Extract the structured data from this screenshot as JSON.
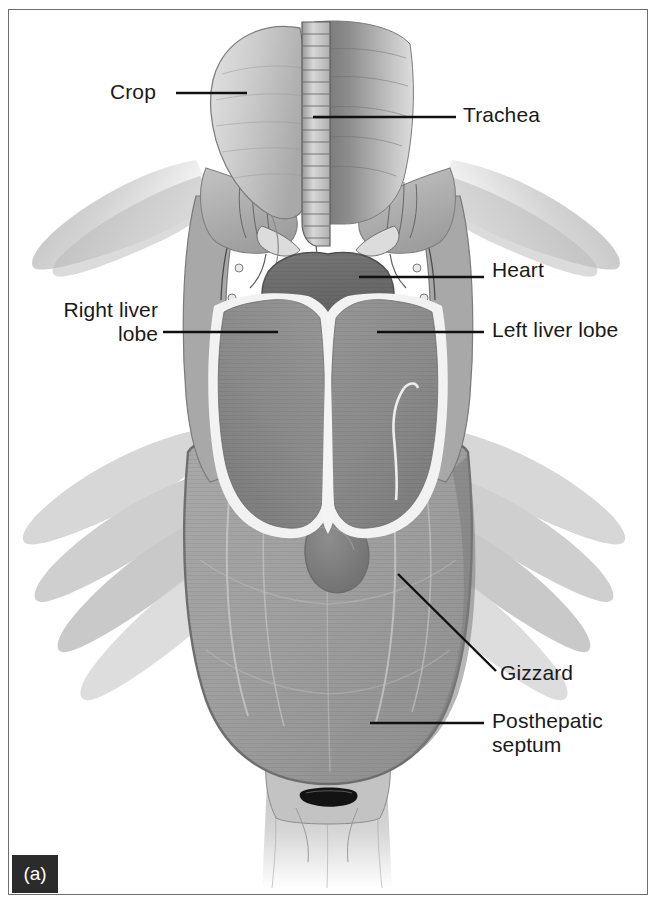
{
  "figure": {
    "panel_tag": "(a)",
    "background_color": "#ffffff",
    "frame_color": "#6d6f71",
    "leader_line_color": "#101010",
    "label_text_color": "#1a1a1a",
    "tag_background_color": "#2b2b2b",
    "tag_text_color": "#ffffff"
  },
  "labels": [
    {
      "id": "crop",
      "text": "Crop",
      "align": "left",
      "x": 110,
      "y": 80,
      "leader": {
        "x1": 176,
        "y1": 93,
        "x2": 247,
        "y2": 93
      }
    },
    {
      "id": "trachea",
      "text": "Trachea",
      "align": "left",
      "x": 463,
      "y": 103,
      "leader": {
        "x1": 313,
        "y1": 117,
        "x2": 456,
        "y2": 117
      }
    },
    {
      "id": "heart",
      "text": "Heart",
      "align": "left",
      "x": 492,
      "y": 258,
      "leader": {
        "x1": 359,
        "y1": 277,
        "x2": 484,
        "y2": 277
      }
    },
    {
      "id": "right-liver-lobe",
      "text": "Right liver\nlobe",
      "align": "right",
      "x": 48,
      "y": 298,
      "leader": {
        "x1": 163,
        "y1": 332,
        "x2": 278,
        "y2": 332
      }
    },
    {
      "id": "left-liver-lobe",
      "text": "Left liver lobe",
      "align": "left",
      "x": 492,
      "y": 318,
      "leader": {
        "x1": 377,
        "y1": 332,
        "x2": 484,
        "y2": 332
      }
    },
    {
      "id": "gizzard",
      "text": "Gizzard",
      "align": "left",
      "x": 500,
      "y": 661,
      "leader": {
        "x1": 398,
        "y1": 574,
        "x2": 496,
        "y2": 671
      }
    },
    {
      "id": "posthepatic-septum",
      "text": "Posthepatic\nseptum",
      "align": "left",
      "x": 492,
      "y": 709,
      "leader": {
        "x1": 370,
        "y1": 723,
        "x2": 484,
        "y2": 723
      }
    }
  ],
  "structures": [
    {
      "id": "crop",
      "name": "Crop",
      "tone": "#c9c9c9"
    },
    {
      "id": "trachea",
      "name": "Trachea",
      "tone": "#b4b4b4"
    },
    {
      "id": "esophagus",
      "name": "Esophagus",
      "tone": "#8e8e8e"
    },
    {
      "id": "heart",
      "name": "Heart",
      "tone": "#6e6e6e"
    },
    {
      "id": "right-liver-lobe",
      "name": "Right liver lobe",
      "tone": "#8b8b8b"
    },
    {
      "id": "left-liver-lobe",
      "name": "Left liver lobe",
      "tone": "#8b8b8b"
    },
    {
      "id": "liver-capsule",
      "name": "Liver capsule",
      "tone": "#f2f2f2"
    },
    {
      "id": "posthepatic-septum",
      "name": "Posthepatic septum",
      "tone": "#9d9d9d"
    },
    {
      "id": "gizzard",
      "name": "Gizzard",
      "tone": "#7c7c7c"
    },
    {
      "id": "pectoral-muscle",
      "name": "Pectoral musculature",
      "tone": "#b9b9b9"
    },
    {
      "id": "wing-left",
      "name": "Left wing",
      "tone": "#c4c4c4"
    },
    {
      "id": "wing-right",
      "name": "Right wing",
      "tone": "#c4c4c4"
    },
    {
      "id": "rib-cage",
      "name": "Rib cage",
      "tone": "#a5a5a5"
    },
    {
      "id": "clavicle",
      "name": "Clavicle / coracoid",
      "tone": "#8f8f8f"
    },
    {
      "id": "vent",
      "name": "Vent",
      "tone": "#111111"
    },
    {
      "id": "tail",
      "name": "Tail",
      "tone": "#d4d4d4"
    }
  ]
}
